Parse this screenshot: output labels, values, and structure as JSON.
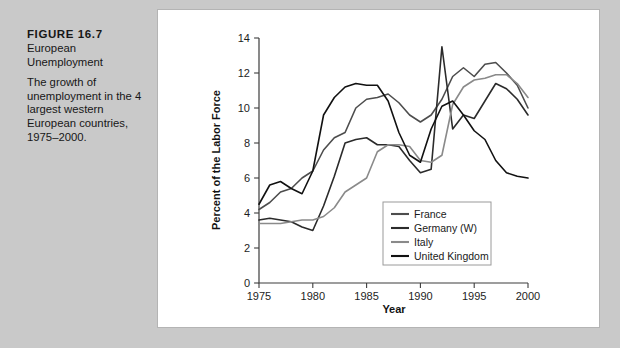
{
  "figure": {
    "label": "FIGURE 16.7",
    "title_line1": "European",
    "title_line2": "Unemployment",
    "description": "The growth of unemployment in the 4 largest western European countries, 1975–2000."
  },
  "colors": {
    "page_background": "#c9c9c9",
    "panel_background": "#ffffff",
    "panel_border": "#b4b4b4",
    "axis": "#3c3c3c",
    "text": "#171717",
    "france": "#4d4d4d",
    "germany": "#2b2b2b",
    "italy": "#8a8a8a",
    "united_kingdom": "#111111"
  },
  "chart_data": {
    "type": "line",
    "title": "European Unemployment",
    "xlabel": "Year",
    "ylabel": "Percent of the Labor Force",
    "xlim": [
      1975,
      2000
    ],
    "ylim": [
      0,
      14
    ],
    "xticks": [
      1975,
      1980,
      1985,
      1990,
      1995,
      2000
    ],
    "yticks": [
      0,
      2,
      4,
      6,
      8,
      10,
      12,
      14
    ],
    "grid": false,
    "legend_position": "lower-right-inside",
    "x": [
      1975,
      1976,
      1977,
      1978,
      1979,
      1980,
      1981,
      1982,
      1983,
      1984,
      1985,
      1986,
      1987,
      1988,
      1989,
      1990,
      1991,
      1992,
      1993,
      1994,
      1995,
      1996,
      1997,
      1998,
      1999,
      2000
    ],
    "series": [
      {
        "name": "France",
        "color": "#4d4d4d",
        "values": [
          4.2,
          4.6,
          5.2,
          5.4,
          6.0,
          6.4,
          7.6,
          8.3,
          8.6,
          10.0,
          10.5,
          10.6,
          10.8,
          10.3,
          9.6,
          9.2,
          9.6,
          10.5,
          11.8,
          12.3,
          11.8,
          12.5,
          12.6,
          12.0,
          11.3,
          10.0
        ]
      },
      {
        "name": "Germany (W)",
        "color": "#2b2b2b",
        "values": [
          3.6,
          3.7,
          3.6,
          3.5,
          3.2,
          3.0,
          4.4,
          6.1,
          8.0,
          8.2,
          8.3,
          7.9,
          7.9,
          7.8,
          7.0,
          6.3,
          6.5,
          13.5,
          8.8,
          9.6,
          9.4,
          10.4,
          11.4,
          11.1,
          10.5,
          9.6
        ]
      },
      {
        "name": "Italy",
        "color": "#8a8a8a",
        "values": [
          3.4,
          3.4,
          3.4,
          3.5,
          3.6,
          3.6,
          3.8,
          4.3,
          5.2,
          5.6,
          6.0,
          7.5,
          7.9,
          7.9,
          7.8,
          7.0,
          6.9,
          7.3,
          10.2,
          11.2,
          11.6,
          11.7,
          11.9,
          11.9,
          11.4,
          10.6
        ]
      },
      {
        "name": "United Kingdom",
        "color": "#111111",
        "values": [
          4.5,
          5.6,
          5.8,
          5.4,
          5.1,
          6.4,
          9.6,
          10.6,
          11.2,
          11.4,
          11.3,
          11.3,
          10.4,
          8.6,
          7.3,
          6.9,
          8.8,
          10.1,
          10.4,
          9.6,
          8.7,
          8.2,
          7.0,
          6.3,
          6.1,
          6.0
        ]
      }
    ]
  },
  "legend": {
    "items": [
      {
        "label": "France"
      },
      {
        "label": "Germany (W)"
      },
      {
        "label": "Italy"
      },
      {
        "label": "United Kingdom"
      }
    ]
  }
}
